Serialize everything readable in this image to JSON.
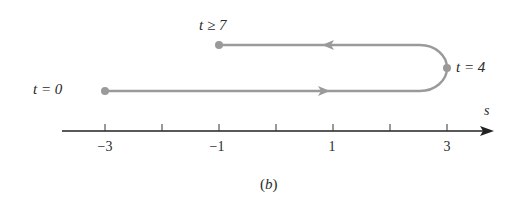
{
  "figure": {
    "caption": "(b)",
    "axis": {
      "variable": "s",
      "tick_values": [
        -3,
        -2,
        -1,
        0,
        1,
        2,
        3
      ],
      "labeled_ticks": [
        "−3",
        "−1",
        "1",
        "3"
      ]
    },
    "path_labels": {
      "start": "t = 0",
      "turn": "t = 4",
      "end": "t ≥ 7"
    },
    "path": {
      "start_s": -3,
      "turn_s": 3,
      "end_s": -1,
      "direction": "right then left"
    },
    "colors": {
      "path": "#9a9a9a",
      "axis": "#222222"
    }
  }
}
